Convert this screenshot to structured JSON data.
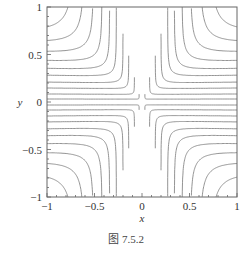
{
  "chart_data": {
    "type": "contour",
    "title": "",
    "xlabel": "x",
    "ylabel": "y",
    "xlim": [
      -1,
      1
    ],
    "ylim": [
      -1,
      1
    ],
    "xticks": [
      "-1",
      "-0.5",
      "0",
      "0.5",
      "1"
    ],
    "yticks": [
      "-1",
      "-0.5",
      "0",
      "0.5",
      "1"
    ],
    "grid": false,
    "legend": null,
    "contour_levels_asymptote": [
      0.03,
      0.08,
      0.14,
      0.2,
      0.27,
      0.34,
      0.42,
      0.51,
      0.61,
      0.72,
      0.85
    ],
    "symmetry": "four-quadrant mirror (saddle-like rounded-corner level curves)",
    "line_color": "#888888"
  },
  "caption": "图 7.5.2"
}
